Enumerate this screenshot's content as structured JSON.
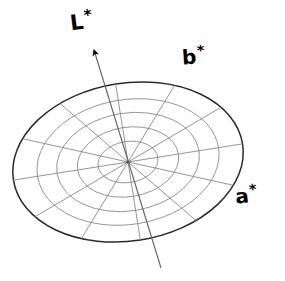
{
  "figure": {
    "name": "cielab-color-space-diagram",
    "type": "diagram",
    "background_color": "#ffffff",
    "width": 285,
    "height": 281
  },
  "axes": {
    "lightness": {
      "label": "L",
      "star": "*",
      "full_label": "L*",
      "description": "vertical lightness axis with arrowhead",
      "arrow_tip": [
        92,
        42
      ],
      "arrow_tail": [
        161,
        268
      ],
      "color": "#666666"
    },
    "b_axis": {
      "label": "b",
      "star": "*",
      "full_label": "b*",
      "color": "#000000"
    },
    "a_axis": {
      "label": "a",
      "star": "*",
      "full_label": "a*",
      "color": "#000000"
    }
  },
  "disc": {
    "center": [
      128,
      162
    ],
    "outer_rx": 116,
    "outer_ry": 79,
    "ring_radii_ratio": [
      1.0,
      0.79,
      0.62,
      0.44,
      0.26
    ],
    "ring_count": 4,
    "spoke_count": 6,
    "tilt_deg": -9,
    "line_color": "#8a8a8a",
    "outline_color": "#2b2b2b",
    "fill_color": "#ffffff"
  },
  "segments": {
    "description": "alternating dark and white sectors of the outer annulus",
    "colors": {
      "dark_gray": "#3a3a3a",
      "black": "#000000",
      "white": "#ffffff"
    },
    "items": [
      {
        "name": "segment-upper-right",
        "start_deg": 302,
        "end_deg": 345,
        "fill": "#3a3a3a"
      },
      {
        "name": "segment-upper-left",
        "start_deg": 192,
        "end_deg": 222,
        "fill": "#333333"
      },
      {
        "name": "segment-left",
        "start_deg": 152,
        "end_deg": 192,
        "fill": "#333333"
      },
      {
        "name": "segment-lower-left",
        "start_deg": 72,
        "end_deg": 112,
        "fill": "#000000"
      },
      {
        "name": "segment-right",
        "start_deg": 10,
        "end_deg": 52,
        "fill": "#000000"
      }
    ]
  }
}
